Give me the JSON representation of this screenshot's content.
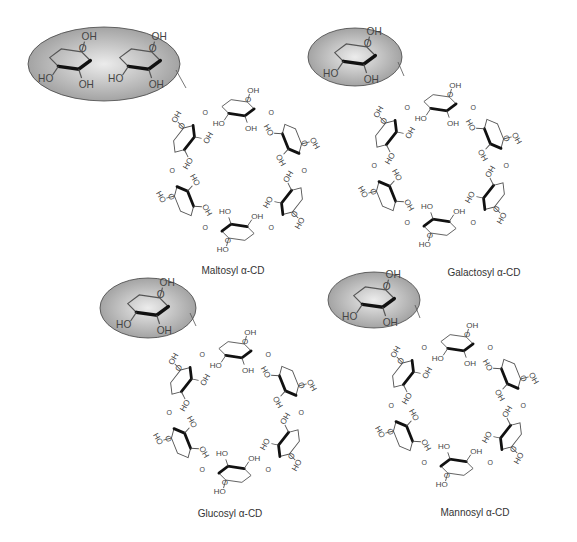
{
  "figure": {
    "panels": [
      {
        "id": "maltosyl",
        "label": "Maltosyl α-CD",
        "substituent": "maltose",
        "substituent_units": 2,
        "ring_units": 6
      },
      {
        "id": "galactosyl",
        "label": "Galactosyl α-CD",
        "substituent": "galactose",
        "substituent_units": 1,
        "ring_units": 6
      },
      {
        "id": "glucosyl",
        "label": "Glucosyl α-CD",
        "substituent": "glucose",
        "substituent_units": 1,
        "ring_units": 6
      },
      {
        "id": "mannosyl",
        "label": "Mannosyl α-CD",
        "substituent": "mannose",
        "substituent_units": 1,
        "ring_units": 6
      }
    ],
    "atom_labels": {
      "hydroxyl_right": "OH",
      "hydroxyl_left": "HO",
      "oxygen": "O"
    },
    "colors": {
      "highlight_fill": "#a8a8a8",
      "highlight_center": "#e6e6e6",
      "bond": "#555555",
      "wedge": "#111111",
      "text": "#333333"
    }
  }
}
